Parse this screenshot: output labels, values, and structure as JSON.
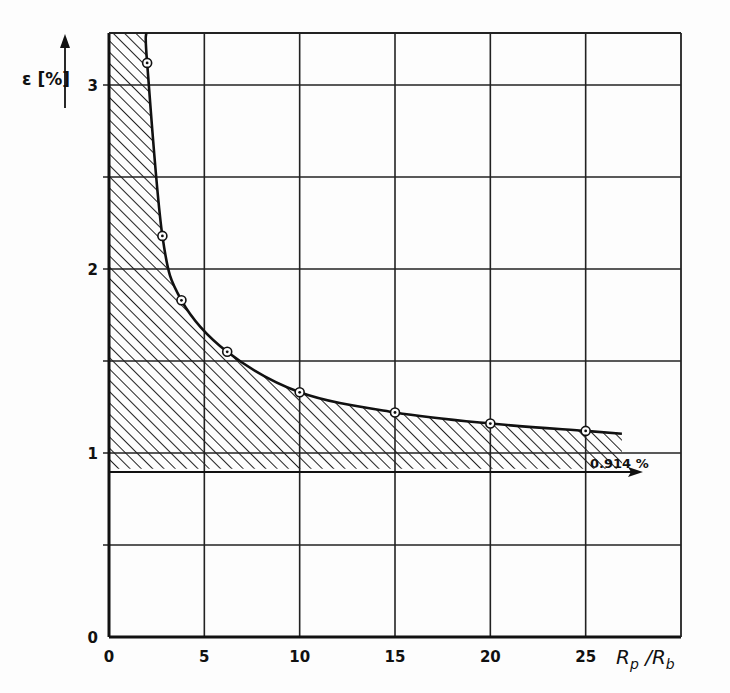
{
  "chart_data": {
    "type": "line",
    "title": "",
    "xlabel": "Rp / Rb",
    "ylabel": "ε [%]",
    "xlim": [
      0,
      30
    ],
    "ylim": [
      0,
      3.3
    ],
    "grid": true,
    "x_ticks": [
      0,
      5,
      10,
      15,
      20,
      25
    ],
    "x_tick_labels": [
      "0",
      "5",
      "10",
      "15",
      "20",
      "25"
    ],
    "y_ticks": [
      0,
      1,
      2,
      3
    ],
    "y_tick_labels": [
      "0",
      "1",
      "2",
      "3"
    ],
    "y_gridlines": [
      0,
      0.5,
      1,
      1.5,
      2,
      2.5,
      3
    ],
    "series": [
      {
        "name": "ε vs Rp/Rb",
        "marker": "circle-dot",
        "x": [
          2.0,
          2.8,
          3.8,
          6.2,
          10.0,
          15.0,
          20.0,
          25.0
        ],
        "y": [
          3.12,
          2.18,
          1.83,
          1.55,
          1.33,
          1.22,
          1.16,
          1.12
        ]
      }
    ],
    "asymptote": {
      "value": 0.914,
      "label": "0.914 %"
    },
    "shaded_region": "hatched area between ε = 0.914 % and the curve"
  },
  "labels": {
    "y_axis": "ε [%]",
    "x_axis_main": "R",
    "x_axis_sub1": "p",
    "x_axis_sep": " /R",
    "x_axis_sub2": "b",
    "asymptote": "0.914 %",
    "xticks": [
      "0",
      "5",
      "10",
      "15",
      "20",
      "25"
    ],
    "yticks": [
      "0",
      "1",
      "2",
      "3"
    ]
  }
}
